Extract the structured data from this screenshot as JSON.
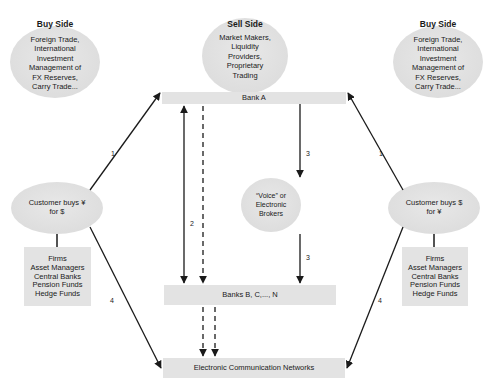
{
  "diagram": {
    "left_buy_side": {
      "title": "Buy Side",
      "lines": [
        "Foreign Trade,",
        "International",
        "Investment",
        "Management of",
        "FX Reserves,",
        "Carry Trade..."
      ]
    },
    "sell_side": {
      "title": "Sell Side",
      "lines": [
        "Market Makers,",
        "Liquidity",
        "Providers,",
        "Proprietary",
        "Trading"
      ]
    },
    "right_buy_side": {
      "title": "Buy Side",
      "lines": [
        "Foreign Trade,",
        "International",
        "Investment",
        "Management of",
        "FX Reserves,",
        "Carry Trade..."
      ]
    },
    "bank_a": {
      "label": "Bank A"
    },
    "banks_bcn": {
      "label": "Banks B, C,..., N"
    },
    "ecn": {
      "label": "Electronic Communication Networks"
    },
    "voice_brokers": {
      "lines": [
        "“Voice” or",
        "Electronic",
        "Brokers"
      ]
    },
    "customer_left": {
      "lines": [
        "Customer buys ¥",
        "for $"
      ]
    },
    "customer_right": {
      "lines": [
        "Customer buys $",
        "for ¥"
      ]
    },
    "firms_left": {
      "lines": [
        "Firms",
        "Asset Managers",
        "Central Banks",
        "Pension Funds",
        "Hedge Funds"
      ]
    },
    "firms_right": {
      "lines": [
        "Firms",
        "Asset Managers",
        "Central Banks",
        "Pension Funds",
        "Hedge Funds"
      ]
    },
    "flow_labels": {
      "left_to_bank_a": "1",
      "right_to_bank_a": "1",
      "bank_a_to_banks_bcn": "2",
      "bank_a_to_brokers": "3",
      "brokers_to_banks_bcn": "3",
      "left_to_ecn": "4",
      "right_to_ecn": "4"
    },
    "colors": {
      "shape_fill": "#e3e3e3",
      "line": "#1a1a1a",
      "background": "#ffffff"
    }
  }
}
